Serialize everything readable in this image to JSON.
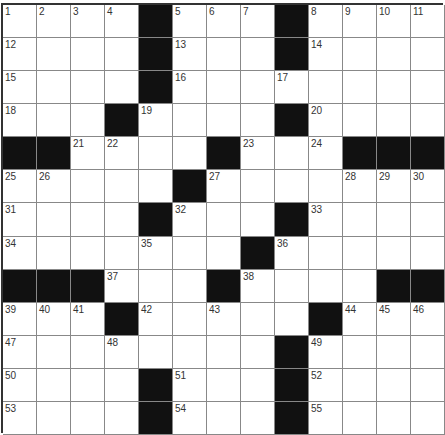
{
  "puzzle": {
    "rows": 13,
    "cols": 13,
    "colors": {
      "black": "#111111",
      "white": "#ffffff",
      "line": "#888888"
    },
    "layout": [
      "1,2,3,4,#,5,6,7,#,8,9,10,11",
      "12,.,.,.,#,13,.,.,#,14,.,.,.",
      "15,.,.,.,#,16,.,.,17,.,.,.,.",
      "18,.,.,#,19,.,.,.,#,20,.,.,.",
      "#,#,21,22,.,.,#,23,.,24,#,#,#",
      "25,26,.,.,.,#,27,.,.,.,28,29,30",
      "31,.,.,.,#,32,.,.,#,33,.,.,.",
      "34,.,.,.,35,.,.,#,36,.,.,.,.",
      "#,#,#,37,.,.,#,38,.,.,.,#,#",
      "39,40,41,#,42,.,43,.,.,#,44,45,46",
      "47,.,.,48,.,.,.,.,#,49,.,.,.",
      "50,.,.,.,#,51,.,.,#,52,.,.,.",
      "53,.,.,.,#,54,.,.,#,55,.,.,."
    ]
  }
}
